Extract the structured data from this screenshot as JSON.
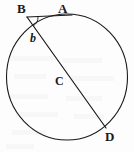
{
  "figure": {
    "kind": "circle-geometry-diagram",
    "background_color": "#fdfdfd",
    "stroke_color": "#1a1a1a",
    "label_color": "#1a1a1a",
    "stroke_width": 1.1,
    "canvas": {
      "width": 134,
      "height": 152
    }
  },
  "circle": {
    "name": "main-circle",
    "center_x": 67,
    "center_y": 77,
    "radius_x": 60.5,
    "radius_y": 63,
    "fill": "none"
  },
  "points": {
    "A": {
      "label": "A",
      "x": 72,
      "y": 15
    },
    "B": {
      "label": "B",
      "x": 27,
      "y": 17
    },
    "C": {
      "label": "C",
      "x": 62,
      "y": 81
    },
    "D": {
      "label": "D",
      "x": 106,
      "y": 128
    }
  },
  "segments": [
    {
      "name": "segment-BA",
      "from": "B",
      "to": "A",
      "label": "B to A"
    },
    {
      "name": "segment-BD",
      "from": "B",
      "to": "D",
      "label": "B to D"
    }
  ],
  "angle": {
    "label": "b",
    "at_vertex": "B",
    "arc_radius": 11
  },
  "labels": {
    "A": "A",
    "B": "B",
    "C": "C",
    "D": "D",
    "angle_b": "b"
  }
}
